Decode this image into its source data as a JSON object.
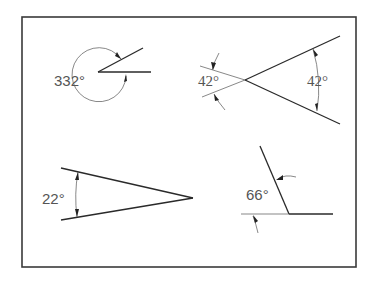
{
  "figure": {
    "frame": {
      "x": 22,
      "y": 17,
      "width": 334,
      "height": 250
    },
    "angles": [
      {
        "id": "angle-332",
        "label": "332°",
        "value": 332,
        "position": "top-left",
        "style": "arc outside, reflex angle"
      },
      {
        "id": "angle-42-left",
        "label": "42°",
        "value": 42,
        "position": "top-right-left",
        "style": "arrows outside, extension lines"
      },
      {
        "id": "angle-42-right",
        "label": "42°",
        "value": 42,
        "position": "top-right-inside",
        "style": "arc inside"
      },
      {
        "id": "angle-22",
        "label": "22°",
        "value": 22,
        "position": "bottom-left",
        "style": "arc inside"
      },
      {
        "id": "angle-66",
        "label": "66°",
        "value": 66,
        "position": "bottom-right",
        "style": "arrows outside"
      }
    ]
  }
}
